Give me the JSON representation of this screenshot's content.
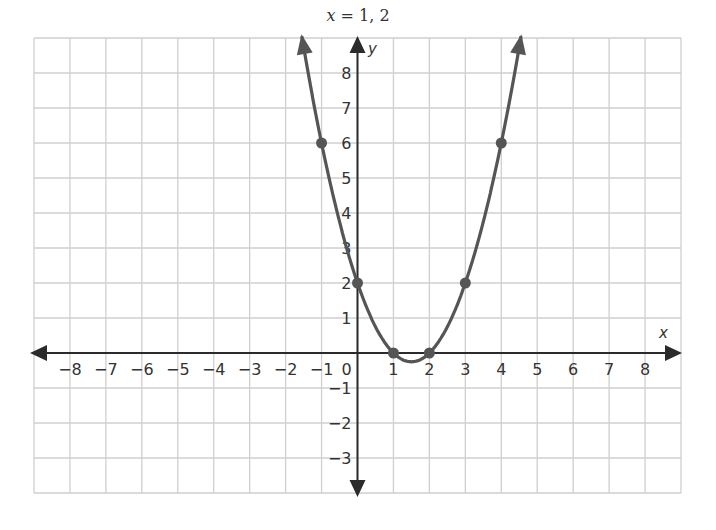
{
  "chart_data": {
    "type": "line",
    "title": "x = 1, 2",
    "title_parts": {
      "var": "x",
      "rest": " = 1, 2"
    },
    "xlabel": "x",
    "ylabel": "y",
    "function": "y = x^2 - 3x + 2",
    "xlim": [
      -9,
      9
    ],
    "ylim": [
      -4,
      9
    ],
    "grid": true,
    "x_ticks": [
      -8,
      -7,
      -6,
      -5,
      -4,
      -3,
      -2,
      -1,
      0,
      1,
      2,
      3,
      4,
      5,
      6,
      7,
      8
    ],
    "x_tick_labels": [
      "−8",
      "−7",
      "−6",
      "−5",
      "−4",
      "−3",
      "−2",
      "−1",
      "0",
      "1",
      "2",
      "3",
      "4",
      "5",
      "6",
      "7",
      "8"
    ],
    "y_ticks": [
      8,
      7,
      6,
      5,
      4,
      3,
      2,
      1,
      -1,
      -2,
      -3
    ],
    "y_tick_labels": [
      "8",
      "7",
      "6",
      "5",
      "4",
      "3",
      "2",
      "1",
      "−1",
      "−2",
      "−3"
    ],
    "series": [
      {
        "name": "parabola",
        "x": [
          -1,
          0,
          1,
          2,
          3,
          4
        ],
        "y": [
          6,
          2,
          0,
          0,
          2,
          6
        ]
      }
    ],
    "points": [
      {
        "x": -1,
        "y": 6
      },
      {
        "x": 0,
        "y": 2
      },
      {
        "x": 1,
        "y": 0
      },
      {
        "x": 2,
        "y": 0
      },
      {
        "x": 3,
        "y": 2
      },
      {
        "x": 4,
        "y": 6
      }
    ],
    "annotations": [
      "roots at x = 1 and x = 2"
    ],
    "legend": null
  },
  "colors": {
    "grid": "#cfcfcf",
    "axis": "#2b2b2b",
    "curve": "#555555",
    "point": "#555555",
    "text": "#333333"
  }
}
